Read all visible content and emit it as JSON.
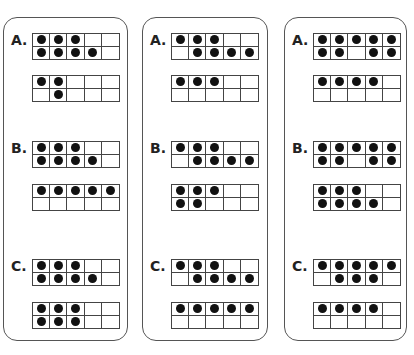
{
  "cards": [
    {
      "problems": [
        {
          "label": "A.",
          "top_frame": [
            [
              1,
              1,
              1,
              0,
              0
            ],
            [
              1,
              1,
              1,
              1,
              0
            ]
          ],
          "bottom_frame": [
            [
              1,
              1,
              0,
              0,
              0
            ],
            [
              0,
              1,
              0,
              0,
              0
            ]
          ]
        },
        {
          "label": "B.",
          "top_frame": [
            [
              1,
              1,
              1,
              0,
              0
            ],
            [
              1,
              1,
              1,
              1,
              0
            ]
          ],
          "bottom_frame": [
            [
              1,
              1,
              1,
              1,
              1
            ],
            [
              0,
              0,
              0,
              0,
              0
            ]
          ]
        },
        {
          "label": "C.",
          "top_frame": [
            [
              1,
              1,
              1,
              0,
              0
            ],
            [
              1,
              1,
              1,
              1,
              0
            ]
          ],
          "bottom_frame": [
            [
              1,
              1,
              1,
              0,
              0
            ],
            [
              1,
              1,
              1,
              0,
              0
            ]
          ]
        }
      ]
    },
    {
      "problems": [
        {
          "label": "A.",
          "top_frame": [
            [
              1,
              1,
              1,
              0,
              0
            ],
            [
              0,
              1,
              1,
              1,
              1
            ]
          ],
          "bottom_frame": [
            [
              1,
              1,
              1,
              0,
              0
            ],
            [
              0,
              0,
              0,
              0,
              0
            ]
          ]
        },
        {
          "label": "B.",
          "top_frame": [
            [
              1,
              1,
              1,
              0,
              0
            ],
            [
              0,
              1,
              1,
              1,
              1
            ]
          ],
          "bottom_frame": [
            [
              1,
              1,
              1,
              0,
              0
            ],
            [
              1,
              1,
              0,
              0,
              0
            ]
          ]
        },
        {
          "label": "C.",
          "top_frame": [
            [
              1,
              1,
              1,
              0,
              0
            ],
            [
              0,
              1,
              1,
              1,
              1
            ]
          ],
          "bottom_frame": [
            [
              1,
              1,
              1,
              1,
              1
            ],
            [
              0,
              0,
              0,
              0,
              0
            ]
          ]
        }
      ]
    },
    {
      "problems": [
        {
          "label": "A.",
          "top_frame": [
            [
              1,
              1,
              1,
              1,
              1
            ],
            [
              1,
              1,
              0,
              1,
              1
            ]
          ],
          "bottom_frame": [
            [
              1,
              1,
              1,
              1,
              0
            ],
            [
              0,
              0,
              0,
              0,
              0
            ]
          ]
        },
        {
          "label": "B.",
          "top_frame": [
            [
              1,
              1,
              1,
              1,
              1
            ],
            [
              1,
              1,
              0,
              1,
              1
            ]
          ],
          "bottom_frame": [
            [
              1,
              1,
              1,
              0,
              0
            ],
            [
              1,
              1,
              1,
              1,
              0
            ]
          ]
        },
        {
          "label": "C.",
          "top_frame": [
            [
              1,
              1,
              1,
              1,
              1
            ],
            [
              0,
              1,
              1,
              1,
              0
            ]
          ],
          "bottom_frame": [
            [
              1,
              1,
              1,
              1,
              0
            ],
            [
              0,
              0,
              0,
              0,
              0
            ]
          ]
        }
      ]
    }
  ],
  "colors": {
    "dot": "#111111",
    "border": "#444444",
    "card_border": "#555555"
  }
}
